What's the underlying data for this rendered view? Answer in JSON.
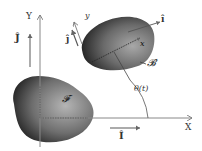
{
  "diagram": {
    "type": "rigid-body-kinematics",
    "global_frame": {
      "x_axis_label": "X",
      "y_axis_label": "Y",
      "unit_vector_x": "Î",
      "unit_vector_y": "Ĵ",
      "origin": [
        40,
        118
      ]
    },
    "fixed_body": {
      "label": "𝓕",
      "color": "#3a3a3a"
    },
    "moving_body": {
      "label": "𝓑",
      "color": "#3a3a3a",
      "local_x_label": "x",
      "local_y_label": "y",
      "unit_vector_x": "î",
      "unit_vector_y": "ĵ"
    },
    "angle": {
      "label": "θ(t)"
    },
    "colors": {
      "axis": "#888888",
      "body_dark": "#1e1e1e",
      "body_light": "#9a9a9a",
      "text": "#333333"
    }
  }
}
